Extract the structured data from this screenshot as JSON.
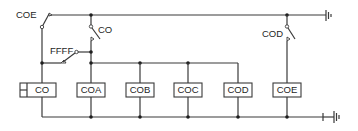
{
  "diagram": {
    "type": "relay-ladder-schematic",
    "colors": {
      "wire": "#3a3a3a",
      "background": "#ffffff",
      "text": "#1e1e1e"
    },
    "switches": [
      {
        "id": "sw-coe",
        "label": "COE"
      },
      {
        "id": "sw-co",
        "label": "CO"
      },
      {
        "id": "sw-ffff",
        "label": "FFFF"
      },
      {
        "id": "sw-cod",
        "label": "COD"
      }
    ],
    "coils": [
      {
        "id": "coil-co",
        "label": "CO"
      },
      {
        "id": "coil-coa",
        "label": "COA"
      },
      {
        "id": "coil-cob",
        "label": "COB"
      },
      {
        "id": "coil-coc",
        "label": "COC"
      },
      {
        "id": "coil-cod",
        "label": "COD"
      },
      {
        "id": "coil-coe",
        "label": "COE"
      }
    ],
    "terminals": [
      {
        "id": "top-ground",
        "icon": "ground-terminal-icon"
      },
      {
        "id": "bottom-battery",
        "icon": "battery-terminal-icon"
      }
    ]
  }
}
